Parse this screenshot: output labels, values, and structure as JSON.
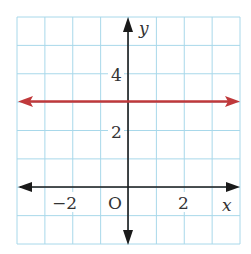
{
  "chart_data": {
    "type": "line",
    "title": "",
    "xlabel": "x",
    "ylabel": "y",
    "xlim": [
      -4,
      4
    ],
    "ylim": [
      -2,
      6
    ],
    "grid": true,
    "grid_step": 1,
    "x_ticks": [
      {
        "value": -2,
        "label": "−2"
      },
      {
        "value": 2,
        "label": "2"
      }
    ],
    "y_ticks": [
      {
        "value": 2,
        "label": "2"
      },
      {
        "value": 4,
        "label": "4"
      }
    ],
    "origin_label": "O",
    "series": [
      {
        "name": "y = 3",
        "type": "horizontal-line",
        "y": 3,
        "x": [
          -4,
          4
        ],
        "values": [
          3,
          3
        ],
        "color": "#c0393b",
        "arrows": "both"
      }
    ]
  },
  "colors": {
    "grid": "#a8d8ea",
    "axis": "#1a1a1a",
    "line": "#c0393b"
  }
}
